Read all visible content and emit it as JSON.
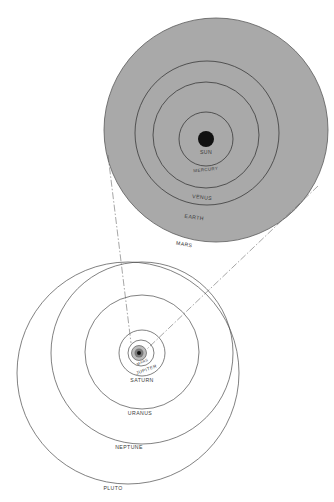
{
  "colors": {
    "background": "#ffffff",
    "inner_system_fill": "#a9a9a9",
    "orbit_stroke": "#4a4a4a",
    "sun_fill": "#111111",
    "label": "#3a3a3a"
  },
  "inner_system": {
    "sun": {
      "label": "SUN",
      "cx": 206,
      "cy": 139,
      "r": 8
    },
    "orbits": [
      {
        "label": "MERCURY",
        "cx": 206,
        "cy": 139,
        "r": 27
      },
      {
        "label": "VENUS",
        "cx": 206,
        "cy": 135,
        "r": 53
      },
      {
        "label": "EARTH",
        "cx": 207,
        "cy": 133,
        "r": 72
      },
      {
        "label": "MARS",
        "cx": 216,
        "cy": 130,
        "r": 112
      }
    ]
  },
  "outer_system": {
    "core": {
      "cx": 139,
      "cy": 353,
      "r": 5
    },
    "inner_ring": {
      "cx": 139,
      "cy": 353,
      "r": 8
    },
    "orbits": [
      {
        "label": "JUPITER",
        "cx": 141,
        "cy": 353,
        "r": 13
      },
      {
        "label": "SATURN",
        "cx": 142,
        "cy": 353,
        "r": 23
      },
      {
        "label": "URANUS",
        "cx": 142,
        "cy": 352,
        "r": 57
      },
      {
        "label": "NEPTUNE",
        "cx": 142,
        "cy": 353,
        "r": 91
      },
      {
        "label": "PLUTO",
        "cx": 128,
        "cy": 373,
        "r": 111
      }
    ],
    "inner_label": "MARS"
  },
  "labels": {
    "sun": "SUN",
    "mercury": "MERCURY",
    "venus": "VENUS",
    "earth": "EARTH",
    "mars": "MARS",
    "mars_small": "MARS",
    "jupiter": "JUPITER",
    "saturn": "SATURN",
    "uranus": "URANUS",
    "neptune": "NEPTUNE",
    "pluto": "PLUTO"
  },
  "connectors": [
    {
      "from": [
        108,
        155
      ],
      "to": [
        131,
        343
      ],
      "style": "dashed"
    },
    {
      "from": [
        318,
        186
      ],
      "to": [
        147,
        349
      ],
      "style": "dashed"
    }
  ]
}
